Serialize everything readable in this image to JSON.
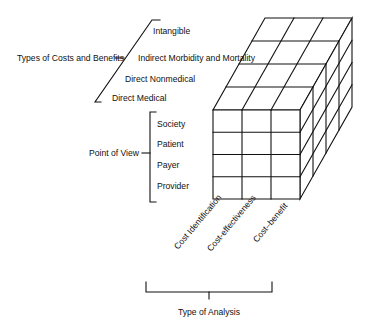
{
  "diagram": {
    "type": "3d-cube-matrix",
    "colors": {
      "line": "#111111",
      "background": "#ffffff"
    },
    "axes": {
      "costs": {
        "title": "Types of Costs and Benefits",
        "items": [
          "Intangible",
          "Indirect Morbidity and Mortality",
          "Direct Nonmedical",
          "Direct Medical"
        ]
      },
      "view": {
        "title": "Point of View",
        "items": [
          "Society",
          "Patient",
          "Payer",
          "Provider"
        ]
      },
      "analysis": {
        "title": "Type of Analysis",
        "items": [
          "Cost Identification",
          "Cost-effectiveness",
          "Cost–benefit"
        ]
      }
    },
    "cube": {
      "columns": 3,
      "rows": 4,
      "depth": 4
    }
  }
}
